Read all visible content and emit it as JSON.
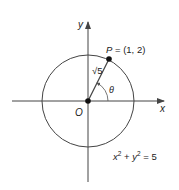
{
  "diagram": {
    "title": "",
    "colors": {
      "stroke": "#444444",
      "point": "#111111",
      "text": "#222222",
      "background": "#ffffff"
    },
    "axes": {
      "x_label": "x",
      "y_label": "y",
      "origin_label": "O"
    },
    "circle": {
      "equation_x": "x",
      "equation_y": "y",
      "equation_exp": "2",
      "equation_rest": "= 5",
      "equation_plus": "+",
      "equation_text": "x² + y² = 5",
      "radius_value": "√5"
    },
    "point": {
      "label": "P = (1, 2)",
      "x": 1,
      "y": 2
    },
    "segment_label_root": "√",
    "segment_label_num": "5",
    "angle_label": "θ"
  }
}
